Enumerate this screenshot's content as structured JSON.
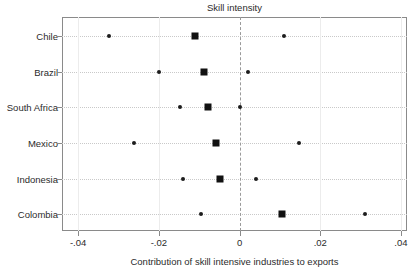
{
  "chart_data": {
    "type": "scatter",
    "title": "Skill intensity",
    "xlabel": "Contribution of skill intensive industries to exports",
    "ylabel": "",
    "xlim": [
      -0.044,
      0.0415
    ],
    "xticks": [
      -0.04,
      -0.02,
      0,
      0.02,
      0.04
    ],
    "xticklabels": [
      "-.04",
      "-.02",
      "0",
      ".02",
      ".04"
    ],
    "categories": [
      "Chile",
      "Brazil",
      "South Africa",
      "Mexico",
      "Indonesia",
      "Colombia"
    ],
    "grid": "horizontal dotted per category; vertical light at x ticks",
    "reference_line": {
      "x": 0,
      "style": "dashed",
      "color": "#9a9a9a"
    },
    "legend": {
      "visible": false,
      "position": "none"
    },
    "series": [
      {
        "name": "lower point",
        "marker": "small-circle",
        "values": [
          -0.0323,
          -0.02,
          -0.0148,
          -0.0262,
          -0.0141,
          -0.0096
        ]
      },
      {
        "name": "estimate",
        "marker": "large-square",
        "values": [
          -0.0111,
          -0.0089,
          -0.0077,
          -0.0059,
          -0.0049,
          0.0106
        ]
      },
      {
        "name": "upper point",
        "marker": "small-circle",
        "values": [
          0.0111,
          0.0022,
          0.0,
          0.0148,
          0.004,
          0.031
        ]
      }
    ],
    "points": [
      {
        "category": "Chile",
        "low": -0.0323,
        "estimate": -0.0111,
        "high": 0.0111
      },
      {
        "category": "Brazil",
        "low": -0.02,
        "estimate": -0.0089,
        "high": 0.0022
      },
      {
        "category": "South Africa",
        "low": -0.0148,
        "estimate": -0.0077,
        "high": 0.0
      },
      {
        "category": "Mexico",
        "low": -0.0262,
        "estimate": -0.0059,
        "high": 0.0148
      },
      {
        "category": "Indonesia",
        "low": -0.0141,
        "estimate": -0.0049,
        "high": 0.004
      },
      {
        "category": "Colombia",
        "low": -0.0096,
        "estimate": 0.0106,
        "high": 0.031
      }
    ],
    "colors": {
      "marker": "#111111",
      "frame": "#8a8a8a",
      "grid": "#c9c9c9",
      "reference": "#9a9a9a",
      "text": "#2b2b2b"
    }
  }
}
